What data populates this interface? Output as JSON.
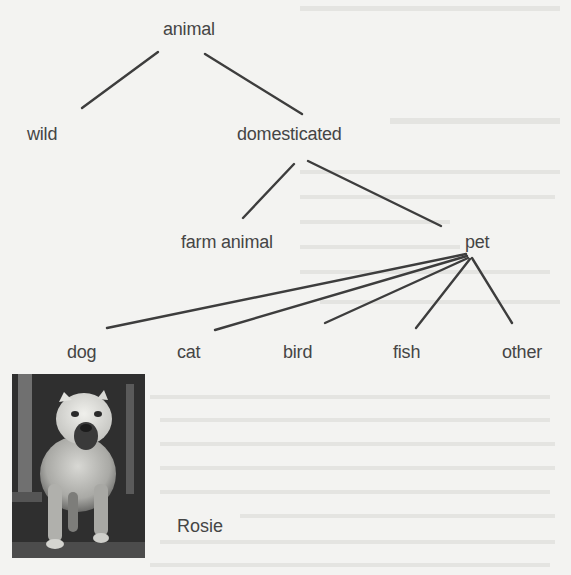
{
  "diagram": {
    "type": "tree",
    "nodes": {
      "root": "animal",
      "wild": "wild",
      "domesticated": "domesticated",
      "farm_animal": "farm animal",
      "pet": "pet",
      "dog": "dog",
      "cat": "cat",
      "bird": "bird",
      "fish": "fish",
      "other": "other"
    },
    "edges": [
      [
        "animal",
        "wild"
      ],
      [
        "animal",
        "domesticated"
      ],
      [
        "domesticated",
        "farm animal"
      ],
      [
        "domesticated",
        "pet"
      ],
      [
        "pet",
        "dog"
      ],
      [
        "pet",
        "cat"
      ],
      [
        "pet",
        "bird"
      ],
      [
        "pet",
        "fish"
      ],
      [
        "pet",
        "other"
      ]
    ],
    "line_color": "#3d3d3d",
    "text_color": "#454545",
    "background_color": "#f3f3f1"
  },
  "photo": {
    "subject": "dog-photo",
    "caption": "Rosie"
  }
}
